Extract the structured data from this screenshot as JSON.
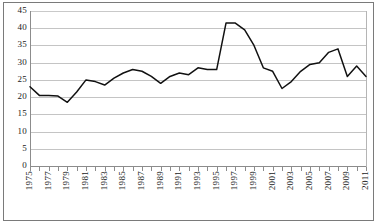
{
  "chart_data": {
    "type": "line",
    "title": "",
    "subtitle": "",
    "xlabel": "",
    "ylabel": "",
    "grid": "horizontal",
    "legend": "none",
    "xlim": [
      1975,
      2011
    ],
    "ylim": [
      0,
      45
    ],
    "ytick_step": 5,
    "yticks": [
      45,
      40,
      35,
      30,
      25,
      20,
      15,
      10,
      5,
      0
    ],
    "ytick_labels": [
      "45",
      "40",
      "35",
      "30",
      "25",
      "20",
      "15",
      "10",
      "5",
      "0"
    ],
    "xticks_labeled": [
      1975,
      1977,
      1979,
      1981,
      1983,
      1985,
      1987,
      1989,
      1991,
      1993,
      1995,
      1997,
      1999,
      2001,
      2003,
      2005,
      2007,
      2009,
      2011
    ],
    "xtick_labels": [
      "1975",
      "1977",
      "1979",
      "1981",
      "1983",
      "1985",
      "1987",
      "1989",
      "1991",
      "1993",
      "1995",
      "1997",
      "1999",
      "2001",
      "2003",
      "2005",
      "2007",
      "2009",
      "2011"
    ],
    "x": [
      1975,
      1976,
      1977,
      1978,
      1979,
      1980,
      1981,
      1982,
      1983,
      1984,
      1985,
      1986,
      1987,
      1988,
      1989,
      1990,
      1991,
      1992,
      1993,
      1994,
      1995,
      1996,
      1997,
      1998,
      1999,
      2000,
      2001,
      2002,
      2003,
      2004,
      2005,
      2006,
      2007,
      2008,
      2009,
      2010,
      2011
    ],
    "series": [
      {
        "name": "series-1",
        "color": "#111111",
        "values": [
          23.0,
          20.5,
          20.5,
          20.3,
          18.5,
          21.5,
          25.0,
          24.5,
          23.5,
          25.5,
          27.0,
          28.0,
          27.5,
          26.0,
          24.0,
          26.0,
          27.0,
          26.5,
          28.5,
          28.0,
          28.0,
          41.5,
          41.5,
          39.5,
          35.0,
          28.5,
          27.5,
          22.5,
          24.5,
          27.5,
          29.5,
          30.0,
          33.0,
          34.0,
          26.0,
          29.0,
          26.0
        ]
      }
    ],
    "colors": {
      "line": "#111111",
      "grid": "#c4c4c4",
      "axis": "#8c8c8c",
      "frame": "#7a7a7a",
      "text": "#1a1a1a",
      "background": "#ffffff"
    }
  }
}
